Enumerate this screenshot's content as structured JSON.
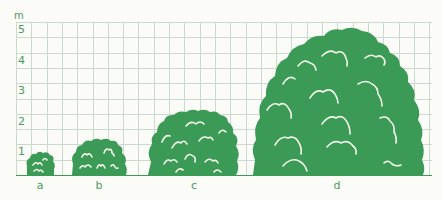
{
  "figure": {
    "unit_label": "m",
    "y_ticks": [
      "5",
      "4",
      "3",
      "2",
      "1"
    ],
    "shrub_labels": [
      "a",
      "b",
      "c",
      "d"
    ],
    "colors": {
      "shrub": "#3b9a56",
      "highlight": "#f4f8ea",
      "grid": "#cbd9cf",
      "axis": "#3b9a56",
      "label": "#4c9a62"
    }
  },
  "chart_data": {
    "type": "bar",
    "title": "",
    "xlabel": "",
    "ylabel": "m",
    "categories": [
      "a",
      "b",
      "c",
      "d"
    ],
    "values": [
      0.75,
      1.25,
      2.2,
      4.85
    ],
    "ylim": [
      0,
      5
    ],
    "yticks": [
      1,
      2,
      3,
      4,
      5
    ],
    "grid": true,
    "grid_step_m": 0.5,
    "legend": null,
    "annotations": "Shrub silhouettes of increasing size drawn against a metre grid"
  }
}
